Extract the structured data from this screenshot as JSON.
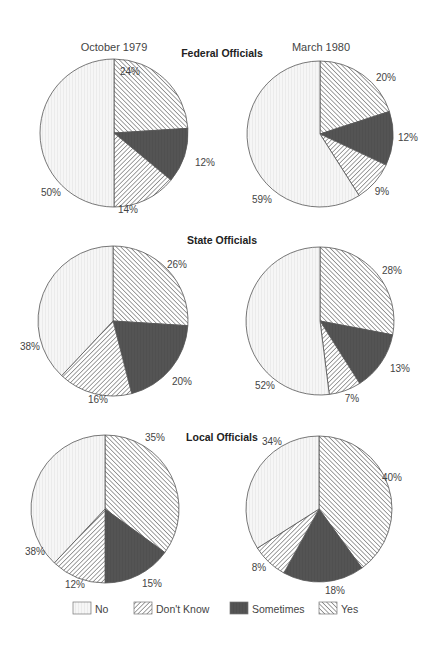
{
  "chart_data": {
    "type": "pie",
    "column_titles": [
      "October 1979",
      "March 1980"
    ],
    "legend": {
      "position": "bottom",
      "items": [
        {
          "key": "no",
          "label": "No"
        },
        {
          "key": "dont_know",
          "label": "Don't Know"
        },
        {
          "key": "sometimes",
          "label": "Sometimes"
        },
        {
          "key": "yes",
          "label": "Yes"
        }
      ]
    },
    "styles": {
      "no": {
        "fill": "#f4f4f4",
        "pattern": "faint-vertical-lines"
      },
      "dont_know": {
        "fill": "#ffffff",
        "pattern": "backslash-hatch"
      },
      "sometimes": {
        "fill": "#555555",
        "pattern": "solid-dark"
      },
      "yes": {
        "fill": "#ffffff",
        "pattern": "forward-slash-hatch"
      }
    },
    "sections": [
      {
        "title": "Federal Officials",
        "charts": [
          {
            "period": "October 1979",
            "slices": [
              {
                "key": "yes",
                "label": "Yes",
                "value": 24,
                "text": "24%"
              },
              {
                "key": "sometimes",
                "label": "Sometimes",
                "value": 12,
                "text": "12%"
              },
              {
                "key": "dont_know",
                "label": "Don't Know",
                "value": 14,
                "text": "14%"
              },
              {
                "key": "no",
                "label": "No",
                "value": 50,
                "text": "50%"
              }
            ]
          },
          {
            "period": "March 1980",
            "slices": [
              {
                "key": "yes",
                "label": "Yes",
                "value": 20,
                "text": "20%"
              },
              {
                "key": "sometimes",
                "label": "Sometimes",
                "value": 12,
                "text": "12%"
              },
              {
                "key": "dont_know",
                "label": "Don't Know",
                "value": 9,
                "text": "9%"
              },
              {
                "key": "no",
                "label": "No",
                "value": 59,
                "text": "59%"
              }
            ]
          }
        ]
      },
      {
        "title": "State Officials",
        "charts": [
          {
            "period": "October 1979",
            "slices": [
              {
                "key": "yes",
                "label": "Yes",
                "value": 26,
                "text": "26%"
              },
              {
                "key": "sometimes",
                "label": "Sometimes",
                "value": 20,
                "text": "20%"
              },
              {
                "key": "dont_know",
                "label": "Don't Know",
                "value": 16,
                "text": "16%"
              },
              {
                "key": "no",
                "label": "No",
                "value": 38,
                "text": "38%"
              }
            ]
          },
          {
            "period": "March 1980",
            "slices": [
              {
                "key": "yes",
                "label": "Yes",
                "value": 28,
                "text": "28%"
              },
              {
                "key": "sometimes",
                "label": "Sometimes",
                "value": 13,
                "text": "13%"
              },
              {
                "key": "dont_know",
                "label": "Don't Know",
                "value": 7,
                "text": "7%"
              },
              {
                "key": "no",
                "label": "No",
                "value": 52,
                "text": "52%"
              }
            ]
          }
        ]
      },
      {
        "title": "Local Officials",
        "charts": [
          {
            "period": "October 1979",
            "slices": [
              {
                "key": "yes",
                "label": "Yes",
                "value": 35,
                "text": "35%"
              },
              {
                "key": "sometimes",
                "label": "Sometimes",
                "value": 15,
                "text": "15%"
              },
              {
                "key": "dont_know",
                "label": "Don't Know",
                "value": 12,
                "text": "12%"
              },
              {
                "key": "no",
                "label": "No",
                "value": 38,
                "text": "38%"
              }
            ]
          },
          {
            "period": "March 1980",
            "slices": [
              {
                "key": "yes",
                "label": "Yes",
                "value": 40,
                "text": "40%"
              },
              {
                "key": "sometimes",
                "label": "Sometimes",
                "value": 18,
                "text": "18%"
              },
              {
                "key": "dont_know",
                "label": "Don't Know",
                "value": 8,
                "text": "8%"
              },
              {
                "key": "no",
                "label": "No",
                "value": 34,
                "text": "34%"
              }
            ]
          }
        ]
      }
    ]
  },
  "layout": {
    "pies": [
      {
        "section": 0,
        "chart": 0,
        "cx": 114,
        "cy": 133,
        "r": 74,
        "labels": [
          [
            130,
            75
          ],
          [
            205,
            166
          ],
          [
            128,
            213
          ],
          [
            51,
            196
          ]
        ]
      },
      {
        "section": 0,
        "chart": 1,
        "cx": 320,
        "cy": 134,
        "r": 73,
        "labels": [
          [
            386,
            81
          ],
          [
            408,
            141
          ],
          [
            382,
            195
          ],
          [
            262,
            203
          ]
        ]
      },
      {
        "section": 1,
        "chart": 0,
        "cx": 113,
        "cy": 321,
        "r": 75,
        "labels": [
          [
            177,
            268
          ],
          [
            182,
            385
          ],
          [
            98,
            403
          ],
          [
            30,
            350
          ]
        ]
      },
      {
        "section": 1,
        "chart": 1,
        "cx": 320,
        "cy": 321,
        "r": 74,
        "labels": [
          [
            392,
            274
          ],
          [
            400,
            372
          ],
          [
            352,
            402
          ],
          [
            265,
            389
          ]
        ]
      },
      {
        "section": 2,
        "chart": 0,
        "cx": 105,
        "cy": 509,
        "r": 74,
        "labels": [
          [
            155,
            441
          ],
          [
            152,
            587
          ],
          [
            75,
            588
          ],
          [
            35,
            555
          ]
        ]
      },
      {
        "section": 2,
        "chart": 1,
        "cx": 319,
        "cy": 509,
        "r": 73,
        "labels": [
          [
            392,
            481
          ],
          [
            335,
            594
          ],
          [
            259,
            571
          ],
          [
            272,
            445
          ]
        ]
      }
    ],
    "column_titles": [
      [
        114,
        51
      ],
      [
        321,
        51
      ]
    ],
    "section_titles": [
      [
        222,
        57
      ],
      [
        222,
        244
      ],
      [
        222,
        441
      ]
    ],
    "legend": {
      "y": 611,
      "items_x": [
        73,
        134,
        230,
        319
      ]
    }
  }
}
